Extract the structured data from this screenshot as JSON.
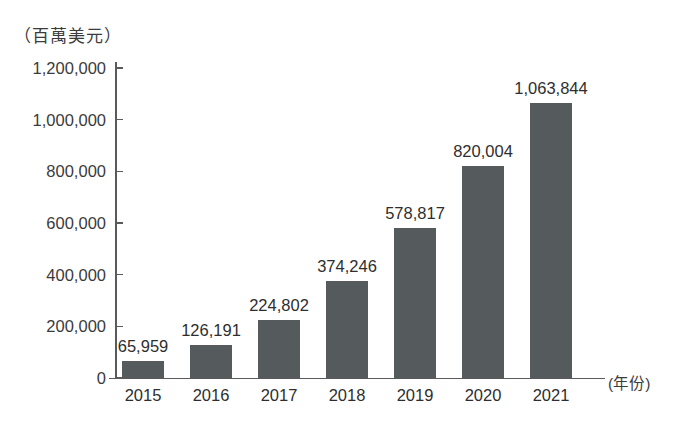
{
  "chart_data": {
    "type": "bar",
    "title": "",
    "subtitle": "",
    "xlabel": "(年份)",
    "ylabel": "（百萬美元）",
    "categories": [
      "2015",
      "2016",
      "2017",
      "2018",
      "2019",
      "2020",
      "2021"
    ],
    "values": [
      65959,
      126191,
      224802,
      374246,
      578817,
      820004,
      1063844
    ],
    "value_labels": [
      "65,959",
      "126,191",
      "224,802",
      "374,246",
      "578,817",
      "820,004",
      "1,063,844"
    ],
    "ylim": [
      0,
      1200000
    ],
    "y_ticks": [
      0,
      200000,
      400000,
      600000,
      800000,
      1000000,
      1200000
    ],
    "y_tick_labels": [
      "0",
      "200,000",
      "400,000",
      "600,000",
      "800,000",
      "1,000,000",
      "1,200,000"
    ],
    "grid": false,
    "legend": false,
    "legend_position": "none",
    "series": [
      {
        "name": "",
        "values": [
          65959,
          126191,
          224802,
          374246,
          578817,
          820004,
          1063844
        ]
      }
    ],
    "colors": {
      "bar": "#555a5c",
      "axis": "#5a5a5a",
      "text": "#2e2e2e",
      "background": "#ffffff"
    }
  }
}
